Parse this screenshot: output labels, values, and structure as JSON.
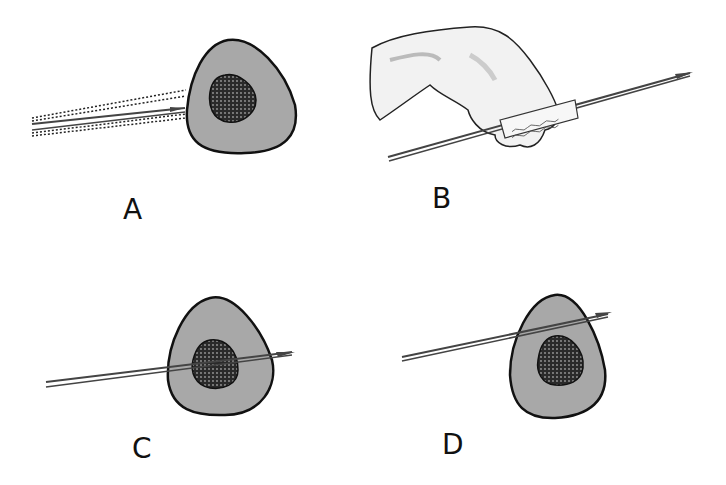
{
  "figure": {
    "colors": {
      "tissue_fill": "#a8a8a8",
      "outline": "#111111",
      "lesion": "#2a2a2a",
      "needle": "#555555",
      "glove": "#f2f2f2"
    },
    "panels": [
      {
        "id": "A",
        "label": "A",
        "content": "Needle inserted toward lesion with dotted guide lines"
      },
      {
        "id": "B",
        "label": "B",
        "content": "Gloved hand holding needle with gauze wrap"
      },
      {
        "id": "C",
        "label": "C",
        "content": "Needle passing through the lesion"
      },
      {
        "id": "D",
        "label": "D",
        "content": "Needle passing above the lesion"
      }
    ]
  }
}
